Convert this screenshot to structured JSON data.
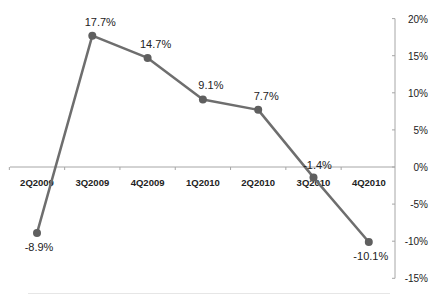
{
  "chart_data": {
    "type": "line",
    "title": "",
    "xlabel": "",
    "ylabel": "",
    "categories": [
      "2Q2009",
      "3Q2009",
      "4Q2009",
      "1Q2010",
      "2Q2010",
      "3Q2010",
      "4Q2010"
    ],
    "series": [
      {
        "name": "Growth",
        "values": [
          -8.9,
          17.7,
          14.7,
          9.1,
          7.7,
          -1.4,
          -10.1
        ]
      }
    ],
    "data_labels": [
      "-8.9%",
      "17.7%",
      "14.7%",
      "9.1%",
      "7.7%",
      "-1.4%",
      "-10.1%"
    ],
    "ylim": [
      -15,
      20
    ],
    "y_ticks": [
      20,
      15,
      10,
      5,
      0,
      -5,
      -10,
      -15
    ],
    "y_tick_labels": [
      "20%",
      "15%",
      "10%",
      "5%",
      "0%",
      "-5%",
      "-10%",
      "-15%"
    ],
    "y_axis_position": "right",
    "grid": false,
    "legend": "none"
  },
  "colors": {
    "line": "#6e6e6e",
    "marker": "#5f5f5f",
    "axis": "#a6a6a6",
    "text": "#222222"
  }
}
